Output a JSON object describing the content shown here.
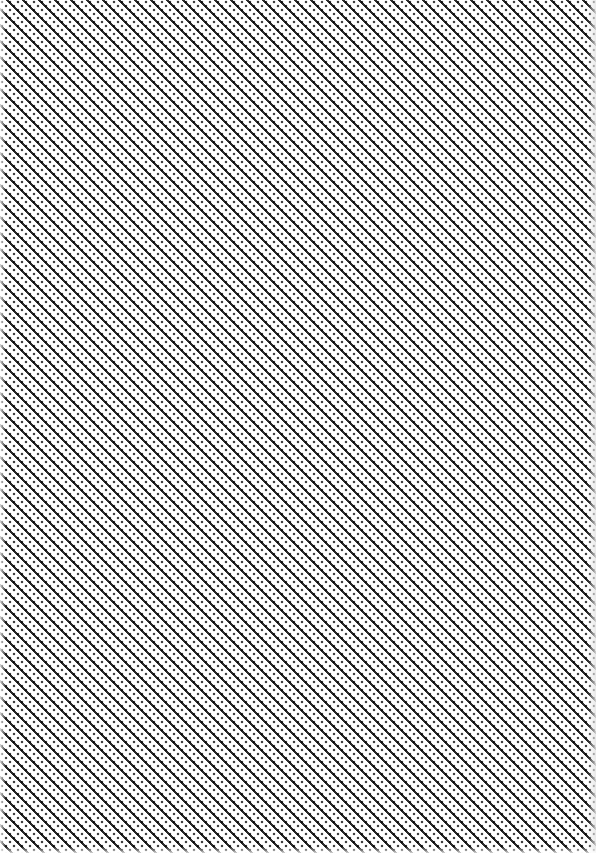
{
  "canvas": {
    "description": "full-frame tiled diagonal pixel pattern",
    "pattern": "diagonal-houndstooth",
    "colors": {
      "background": "#ffffff",
      "foreground": "#2a2a2a"
    }
  }
}
